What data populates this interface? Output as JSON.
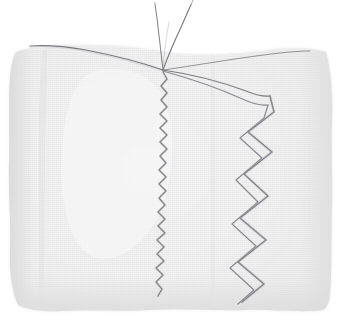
{
  "scene": {
    "title": "Fabric swatch with zigzag machine stitching",
    "width": 341,
    "height": 320,
    "background_color": "#ffffff",
    "description": "A pale off-white woven fabric swatch photographed on a white background. Two lines of machine zigzag stitching run vertically down the cloth, converging with loose thread tails at a point near the top edge."
  },
  "fabric": {
    "name": "fabric-swatch",
    "base_color": "#f2f2f2",
    "shadow_color": "#e4e4e4",
    "weave_color": "#dedede",
    "weave_spacing_px": 2,
    "edge_note": "irregular hand-cut edges, slightly wavy on all four sides",
    "bounds": {
      "left": 8,
      "top": 44,
      "right": 333,
      "bottom": 312
    },
    "outline_path": "M 16,52 C 30,47 52,45 74,45 C 104,44 138,47 168,52 C 200,57 238,54 268,50 C 290,47 312,48 326,52 C 331,70 333,96 332,124 C 331,154 333,182 332,210 C 331,240 332,268 330,294 C 329,302 327,308 323,310 C 300,313 272,309 246,310 C 214,311 182,308 150,310 C 120,312 90,309 62,311 C 44,312 28,310 18,305 C 12,292 9,270 10,248 C 11,218 8,190 9,162 C 10,132 8,104 10,78 C 11,66 13,57 16,52 Z"
  },
  "stitching": {
    "thread_color": "#6e6e72",
    "thread_color_light": "#9a9aa0",
    "apex": {
      "x": 163,
      "y": 70,
      "label": "thread convergence point"
    },
    "elements": [
      {
        "name": "thread-tail-left",
        "type": "loose thread",
        "from": "apex",
        "to": "top edge, slightly left"
      },
      {
        "name": "thread-tail-right",
        "type": "loose thread",
        "from": "apex",
        "to": "top edge, angled right"
      },
      {
        "name": "top-edge-thread-left",
        "type": "thread along fabric top edge",
        "direction": "apex to upper-left"
      },
      {
        "name": "top-edge-thread-right",
        "type": "thread along fabric top edge",
        "direction": "apex to upper-right"
      },
      {
        "name": "narrow-zigzag-seam",
        "type": "fine narrow zigzag stitch",
        "amplitude_px": 4,
        "period_px": 14,
        "x_center": 164,
        "y_start": 72,
        "y_end": 296
      },
      {
        "name": "wide-zigzag-seam",
        "type": "wide double zigzag stitch",
        "amplitude_px": 16,
        "period_px": 48,
        "x_center": 255,
        "y_start": 92,
        "y_end": 302
      },
      {
        "name": "sweep-curve-upper",
        "type": "curved stitch run from apex to wide zigzag",
        "from": "apex",
        "to": "x 270, y 96"
      },
      {
        "name": "sweep-curve-lower",
        "type": "second parallel curved stitch run",
        "from": "apex",
        "to": "x 268, y 104"
      }
    ]
  }
}
